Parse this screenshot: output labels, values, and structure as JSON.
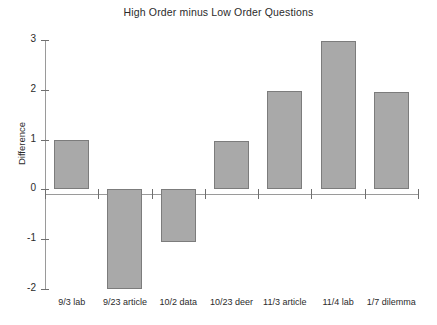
{
  "chart_data": {
    "type": "bar",
    "title": "High Order minus Low Order Questions",
    "xlabel": "",
    "ylabel": "Difference",
    "categories": [
      "9/3 lab",
      "9/23 article",
      "10/2 data",
      "10/23 deer",
      "11/3 article",
      "11/4 lab",
      "1/7 dilemma"
    ],
    "values": [
      1.0,
      -2.0,
      -1.05,
      0.98,
      1.97,
      2.97,
      1.95
    ],
    "ylim": [
      -2,
      3
    ],
    "yticks": [
      3,
      2,
      1,
      0,
      -1,
      -2
    ],
    "ytick_labels": [
      "3",
      "2",
      "1",
      "0",
      "-1",
      "-2"
    ],
    "grid": false,
    "legend": false,
    "bar_color": "#a9a9a9",
    "bar_edge_color": "#7c7c7c",
    "axis_color": "#9a9a9a",
    "background": "#ffffff"
  }
}
